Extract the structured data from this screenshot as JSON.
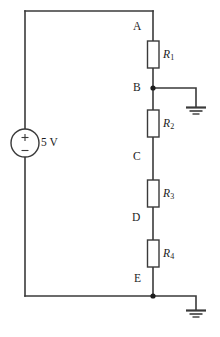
{
  "figure": {
    "type": "circuit-schematic",
    "caption": ""
  },
  "source": {
    "name": "voltage-source",
    "label": "5 V",
    "value": 5,
    "unit": "V",
    "plus_sign": "+",
    "minus_sign": "−",
    "shape": "circle"
  },
  "nodes": [
    {
      "id": "A",
      "label": "A",
      "dot": false
    },
    {
      "id": "B",
      "label": "B",
      "dot": true
    },
    {
      "id": "C",
      "label": "C",
      "dot": false
    },
    {
      "id": "D",
      "label": "D",
      "dot": false
    },
    {
      "id": "E",
      "label": "E",
      "dot": true
    }
  ],
  "resistors": [
    {
      "id": "R1",
      "label": "R",
      "subscript": "1",
      "between": "A-B"
    },
    {
      "id": "R2",
      "label": "R",
      "subscript": "2",
      "between": "B-C"
    },
    {
      "id": "R3",
      "label": "R",
      "subscript": "3",
      "between": "C-D"
    },
    {
      "id": "R4",
      "label": "R",
      "subscript": "4",
      "between": "D-E"
    }
  ],
  "grounds": [
    {
      "id": "ground-b",
      "attached_node": "B",
      "symbol": "earth-ground"
    },
    {
      "id": "ground-e",
      "attached_node": "E",
      "symbol": "earth-ground"
    }
  ],
  "colors": {
    "wire": "#3a3a3a",
    "text": "#1c1c1c",
    "background": "#ffffff",
    "node_dot": "#1c1c1c"
  }
}
